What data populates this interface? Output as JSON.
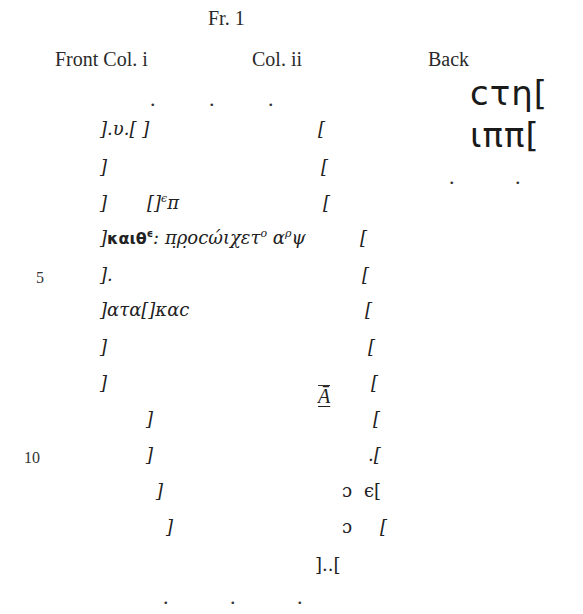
{
  "fragment_title": "Fr. 1",
  "column_headers": {
    "front_col_i": "Front Col. i",
    "col_ii": "Col. ii",
    "back": "Back"
  },
  "top_dots": [
    ".",
    ".",
    "."
  ],
  "bottom_dots": [
    ".",
    ".",
    "."
  ],
  "back_dots": [
    ".",
    "."
  ],
  "line_numbers": {
    "five": "5",
    "ten": "10"
  },
  "front_col_i": {
    "lines": [
      {
        "line": 1,
        "text": "].υ.[ ]"
      },
      {
        "line": 2,
        "text": "]"
      },
      {
        "line": 3,
        "prefix": "]",
        "gap": "[]",
        "sup": "ϵ",
        "text": "π"
      },
      {
        "line": 4,
        "bold": "καιθ",
        "sup1": "ϵ",
        "mark": ":",
        "text": "π̣ρ̣οcώιχετ",
        "sup2": "ο",
        "text2": "α",
        "sup3": "ρ",
        "end": "ψ"
      },
      {
        "line": 5,
        "text": "]."
      },
      {
        "line": 6,
        "text": "]ατα[]καc"
      },
      {
        "line": 7,
        "text": "]"
      },
      {
        "line": 8,
        "text": "]"
      },
      {
        "line": 9,
        "text": "]"
      },
      {
        "line": 10,
        "text": "]"
      },
      {
        "line": 11,
        "text": "]"
      },
      {
        "line": 12,
        "text": "]"
      }
    ]
  },
  "col_ii": {
    "lines": [
      {
        "line": 1,
        "text": "["
      },
      {
        "line": 2,
        "text": "["
      },
      {
        "line": 3,
        "text": "["
      },
      {
        "line": 4,
        "text": "["
      },
      {
        "line": 5,
        "text": "["
      },
      {
        "line": 6,
        "text": "["
      },
      {
        "line": 7,
        "text": "["
      },
      {
        "line": 8,
        "text": "["
      },
      {
        "line": 9,
        "marginal": "Ā",
        "text": "["
      },
      {
        "line": 10,
        "text": ".["
      },
      {
        "line": 11,
        "marginal": "ɔ",
        "text": "ϵ["
      },
      {
        "line": 12,
        "marginal": "ɔ",
        "text": "["
      },
      {
        "line": 13,
        "text": "]..["
      }
    ]
  },
  "back": {
    "lines": [
      {
        "line": 1,
        "text": "cτη["
      },
      {
        "line": 2,
        "text": "ιππ["
      }
    ]
  }
}
